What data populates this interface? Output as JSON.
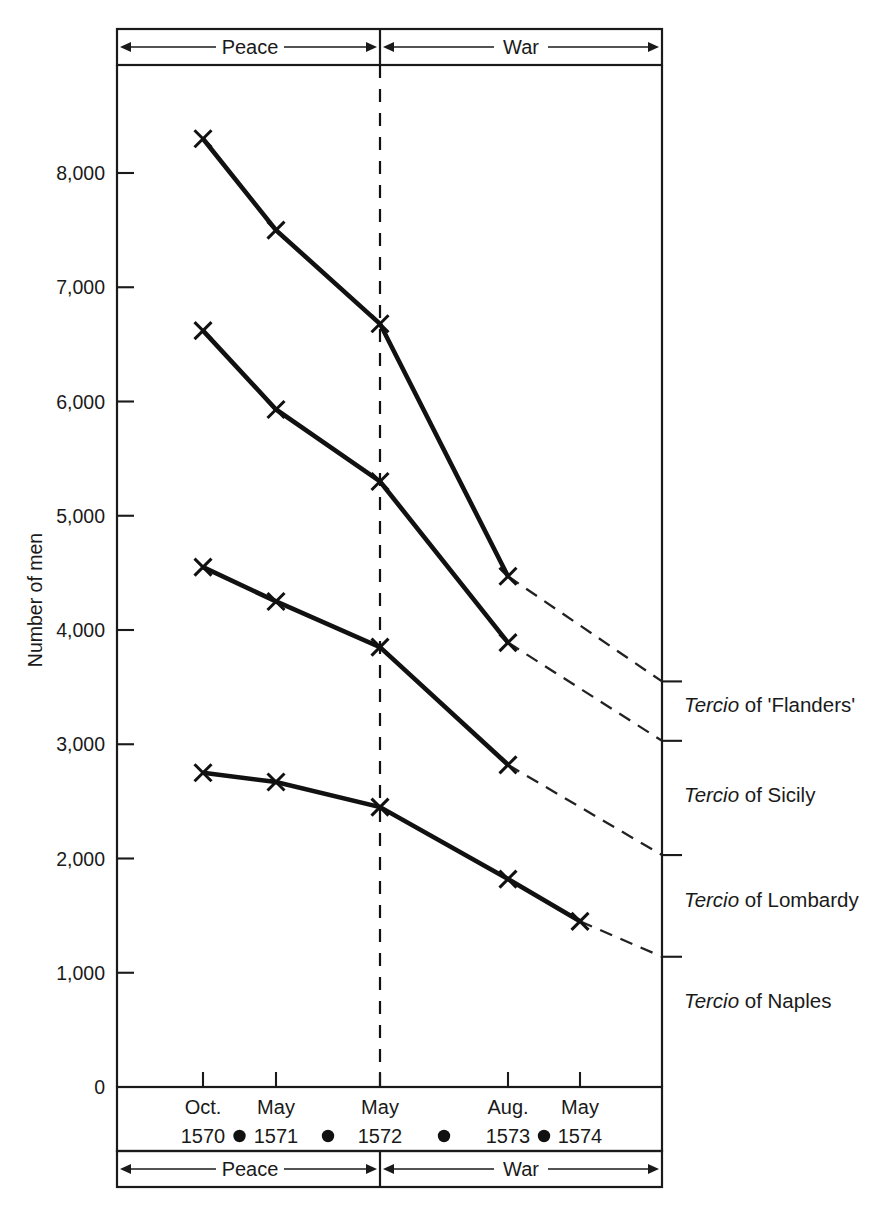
{
  "chart_data": {
    "type": "line",
    "title": "",
    "xlabel": "",
    "ylabel": "Number of men",
    "ylim": [
      0,
      8800
    ],
    "grid": false,
    "legend_position": "right-of-plot",
    "categories": [
      "Oct. 1570",
      "May 1571",
      "May 1572",
      "Aug. 1573",
      "May 1574"
    ],
    "x_months": [
      "Oct.",
      "May",
      "May",
      "Aug.",
      "May"
    ],
    "x_years": [
      "1570",
      "1571",
      "1572",
      "1573",
      "1574"
    ],
    "y_ticks": [
      "0",
      "1,000",
      "2,000",
      "3,000",
      "4,000",
      "5,000",
      "6,000",
      "7,000",
      "8,000"
    ],
    "period_bands": [
      {
        "label": "Peace",
        "from": "Oct. 1570",
        "to": "May 1572"
      },
      {
        "label": "War",
        "from": "May 1572",
        "to": "May 1574"
      }
    ],
    "series": [
      {
        "name": "Tercio of 'Flanders'",
        "legend_italic": "Tercio",
        "legend_rest": " of 'Flanders'",
        "values": [
          8300,
          7500,
          6680,
          4470,
          null
        ],
        "projected_end": 3550
      },
      {
        "name": "Tercio of Sicily",
        "legend_italic": "Tercio",
        "legend_rest": " of Sicily",
        "values": [
          6620,
          5930,
          5300,
          3890,
          null
        ],
        "projected_end": 3030
      },
      {
        "name": "Tercio of Lombardy",
        "legend_italic": "Tercio",
        "legend_rest": " of Lombardy",
        "values": [
          4550,
          4250,
          3850,
          2820,
          null
        ],
        "projected_end": 2030
      },
      {
        "name": "Tercio of Naples",
        "legend_italic": "Tercio",
        "legend_rest": " of Naples",
        "values": [
          2750,
          2670,
          2450,
          1820,
          1450
        ],
        "projected_end": 1140
      }
    ]
  },
  "colors": {
    "ink": "#1a1a1a",
    "line": "#111111",
    "background": "#ffffff"
  }
}
